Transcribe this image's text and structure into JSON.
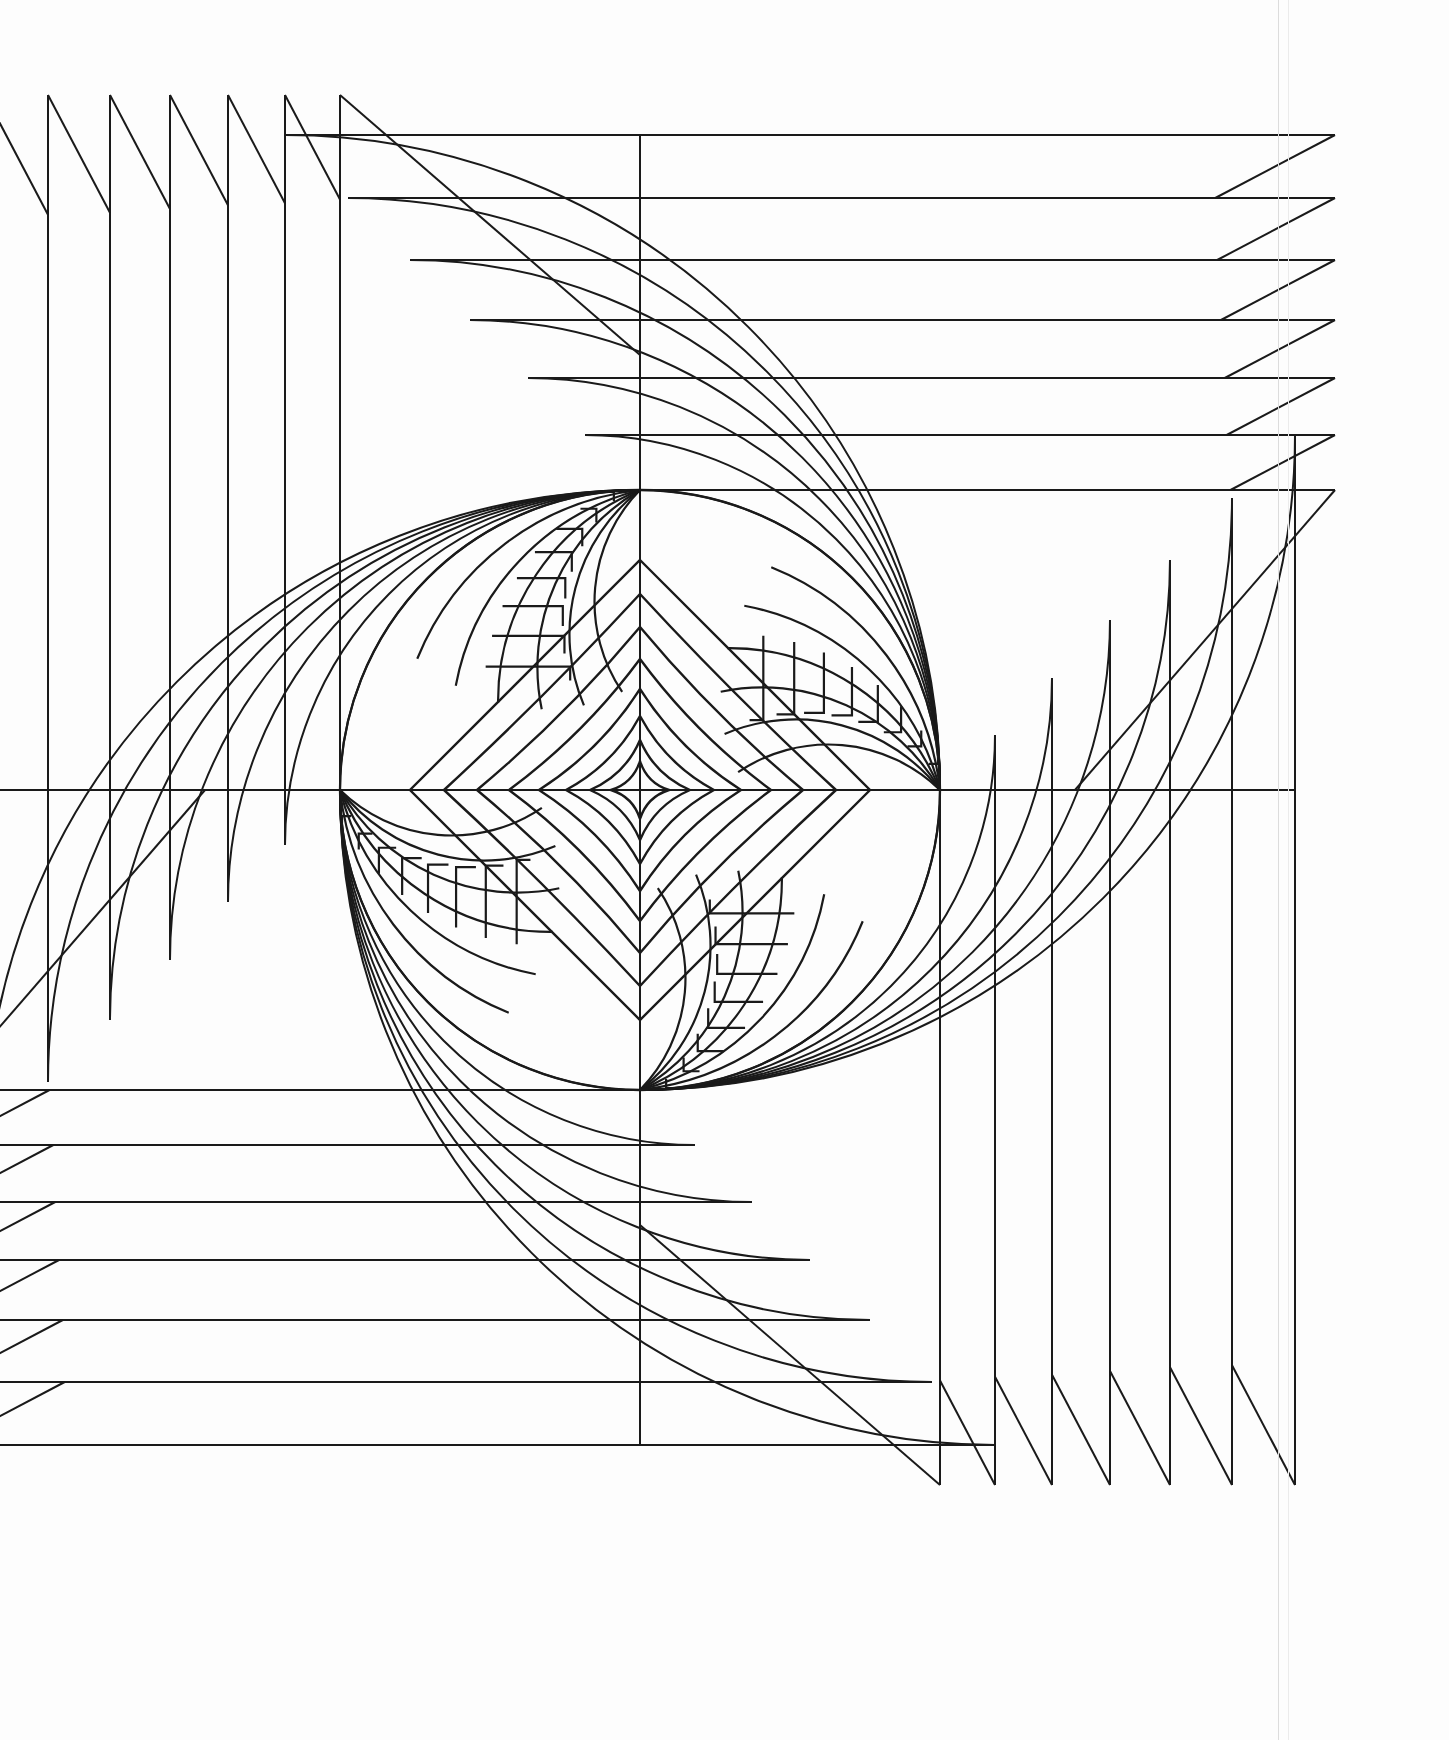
{
  "page": {
    "width": 1449,
    "height": 1740,
    "background_color": "#fdfdfd",
    "stroke_color": "#1a1a1a",
    "paper_right_edge_x": 1278
  },
  "geometry": {
    "center": {
      "x": 640,
      "y": 790
    },
    "circle_radius": 300,
    "nodes": [
      {
        "name": "node-top",
        "x": 640,
        "y": 493,
        "angle_deg": 270
      },
      {
        "name": "node-right",
        "x": 940,
        "y": 790,
        "angle_deg": 0
      },
      {
        "name": "node-bottom",
        "x": 640,
        "y": 1085,
        "angle_deg": 90
      },
      {
        "name": "node-left",
        "x": 335,
        "y": 790,
        "angle_deg": 180
      }
    ],
    "quadrants": [
      {
        "name": "quadrant-top-left",
        "rotation_deg": 0,
        "fringe_direction": "up"
      },
      {
        "name": "quadrant-top-right",
        "rotation_deg": 90,
        "fringe_direction": "right"
      },
      {
        "name": "quadrant-bottom-right",
        "rotation_deg": 180,
        "fringe_direction": "down"
      },
      {
        "name": "quadrant-bottom-left",
        "rotation_deg": 270,
        "fringe_direction": "left"
      }
    ],
    "outer_arc_count": 7,
    "outer_arc_radii": [
      300,
      355,
      412,
      470,
      530,
      592,
      655
    ],
    "outer_fringe_teeth": 7,
    "fringe_extent": 395,
    "inner_spiral_count": 6,
    "inner_step_count": 8,
    "diamond_count": 8,
    "diamond_radii": [
      230,
      196,
      163,
      131,
      101,
      74,
      50,
      29
    ],
    "diamond_concavity": [
      0.0,
      0.04,
      0.09,
      0.15,
      0.22,
      0.3,
      0.4,
      0.52
    ],
    "stroke_width_outer": 2.0,
    "stroke_width_inner": 2.2,
    "stroke_width_diamond": 2.4
  },
  "labels": {
    "artwork_name": "concentric-radial-fan-pattern",
    "symmetry": "4-fold rotational (90 degrees)",
    "medium": "line drawing / ink on paper"
  }
}
